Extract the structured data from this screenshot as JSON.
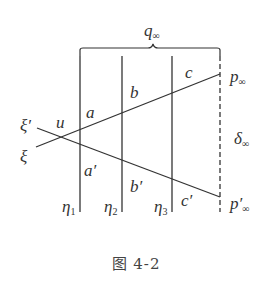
{
  "figure": {
    "caption": "图  4-2",
    "labels": {
      "q": {
        "main": "q",
        "sub": "∞"
      },
      "p": {
        "main": "p",
        "sub": "∞"
      },
      "p_prime": {
        "main": "p′",
        "sub": "∞"
      },
      "delta": {
        "main": "δ",
        "sub": "∞"
      },
      "xi_prime": "ξ′",
      "xi": "ξ",
      "u": "u",
      "a": "a",
      "b": "b",
      "c": "c",
      "a_prime": "a′",
      "b_prime": "b′",
      "c_prime": "c′",
      "eta1": {
        "main": "η",
        "sub": "1"
      },
      "eta2": {
        "main": "η",
        "sub": "2"
      },
      "eta3": {
        "main": "η",
        "sub": "3"
      }
    },
    "colors": {
      "line": "#333333",
      "text": "#333333"
    }
  }
}
